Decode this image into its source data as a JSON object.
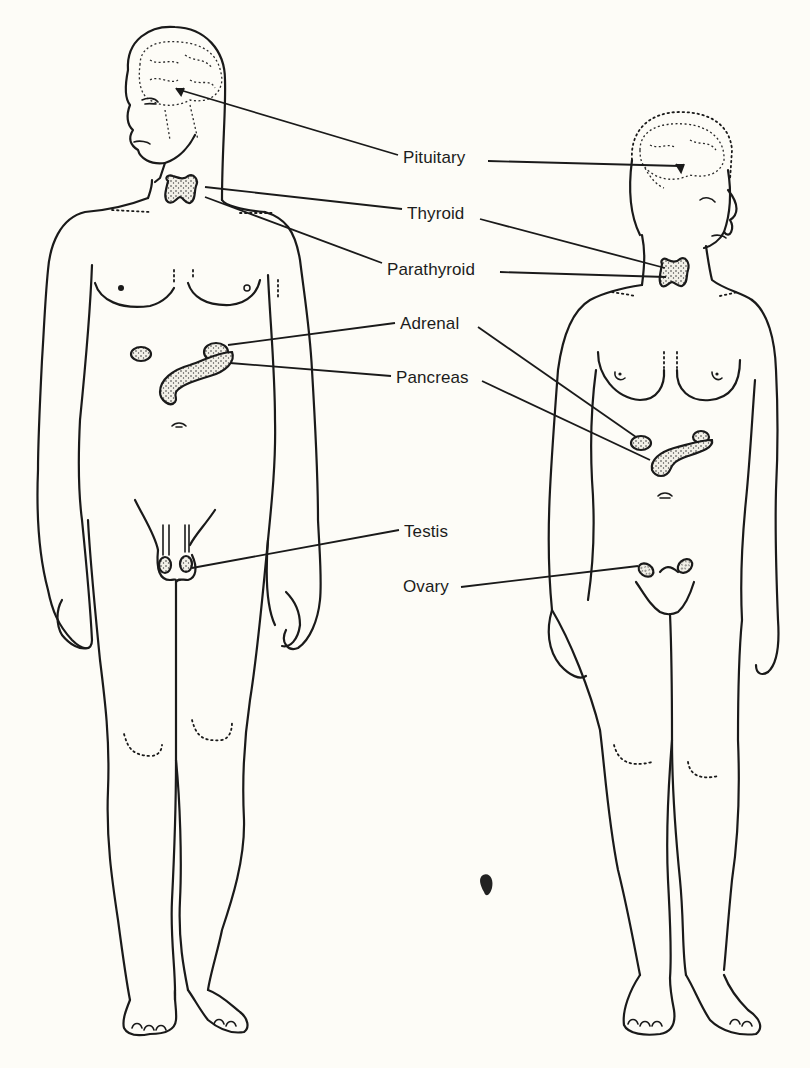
{
  "diagram": {
    "type": "anatomical-illustration",
    "background_color": "#fdfcf7",
    "line_color": "#1a1a1a"
  },
  "labels": [
    {
      "id": "pituitary",
      "text": "Pituitary",
      "x": 403,
      "y": 148
    },
    {
      "id": "thyroid",
      "text": "Thyroid",
      "x": 407,
      "y": 204
    },
    {
      "id": "parathyroid",
      "text": "Parathyroid",
      "x": 387,
      "y": 260
    },
    {
      "id": "adrenal",
      "text": "Adrenal",
      "x": 400,
      "y": 314
    },
    {
      "id": "pancreas",
      "text": "Pancreas",
      "x": 396,
      "y": 368
    },
    {
      "id": "testis",
      "text": "Testis",
      "x": 404,
      "y": 522
    },
    {
      "id": "ovary",
      "text": "Ovary",
      "x": 403,
      "y": 577
    }
  ],
  "figures": [
    {
      "id": "male",
      "glands": [
        "Pituitary",
        "Thyroid",
        "Parathyroid",
        "Adrenal",
        "Pancreas",
        "Testis"
      ]
    },
    {
      "id": "female",
      "glands": [
        "Pituitary",
        "Thyroid",
        "Parathyroid",
        "Adrenal",
        "Pancreas",
        "Ovary"
      ]
    }
  ],
  "leader_lines": [
    {
      "label": "Pituitary",
      "figure": "male",
      "points": [
        [
          398,
          155
        ],
        [
          180,
          90
        ]
      ]
    },
    {
      "label": "Pituitary",
      "figure": "female",
      "points": [
        [
          488,
          161
        ],
        [
          680,
          166
        ]
      ]
    },
    {
      "label": "Thyroid",
      "figure": "male",
      "points": [
        [
          402,
          209
        ],
        [
          205,
          187
        ]
      ]
    },
    {
      "label": "Thyroid",
      "figure": "female",
      "points": [
        [
          480,
          219
        ],
        [
          665,
          268
        ]
      ]
    },
    {
      "label": "Parathyroid",
      "figure": "male",
      "points": [
        [
          382,
          263
        ],
        [
          205,
          197
        ]
      ]
    },
    {
      "label": "Parathyroid",
      "figure": "female",
      "points": [
        [
          500,
          272
        ],
        [
          666,
          277
        ]
      ]
    },
    {
      "label": "Adrenal",
      "figure": "male",
      "points": [
        [
          395,
          323
        ],
        [
          228,
          345
        ]
      ]
    },
    {
      "label": "Adrenal",
      "figure": "female",
      "points": [
        [
          478,
          327
        ],
        [
          636,
          437
        ]
      ]
    },
    {
      "label": "Pancreas",
      "figure": "male",
      "points": [
        [
          391,
          376
        ],
        [
          230,
          363
        ]
      ]
    },
    {
      "label": "Pancreas",
      "figure": "female",
      "points": [
        [
          482,
          381
        ],
        [
          650,
          460
        ]
      ]
    },
    {
      "label": "Testis",
      "figure": "male",
      "points": [
        [
          399,
          530
        ],
        [
          192,
          568
        ]
      ]
    },
    {
      "label": "Ovary",
      "figure": "female",
      "points": [
        [
          461,
          587
        ],
        [
          638,
          566
        ]
      ]
    }
  ]
}
